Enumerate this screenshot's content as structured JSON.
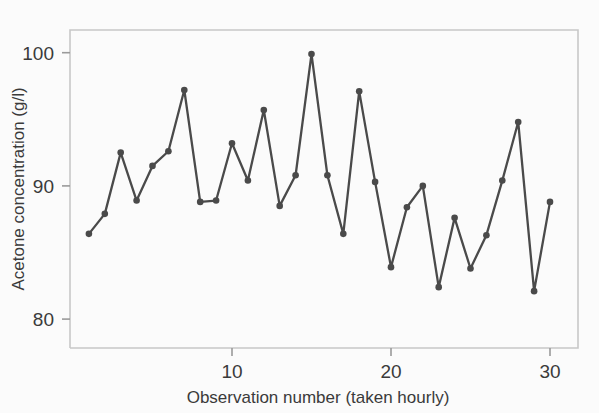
{
  "chart_data": {
    "type": "line",
    "title": "",
    "subtitle": "",
    "xlabel": "Observation number (taken hourly)",
    "ylabel": "Acetone concentration (g/l)",
    "xlim": [
      0.2,
      30.8
    ],
    "ylim": [
      77.5,
      101.2
    ],
    "xticks": [
      10,
      20,
      30
    ],
    "xtick_labels": [
      "10",
      "20",
      "30"
    ],
    "yticks": [
      80,
      90,
      100
    ],
    "ytick_labels": [
      "80",
      "90",
      "100"
    ],
    "grid": false,
    "legend": null,
    "marker": "circle",
    "line_color": "#4a4a4a",
    "marker_color": "#4a4a4a",
    "axis_color": "#b9b9b9",
    "background": "#fbfbfb",
    "x": [
      1,
      2,
      3,
      4,
      5,
      6,
      7,
      8,
      9,
      10,
      11,
      12,
      13,
      14,
      15,
      16,
      17,
      18,
      19,
      20,
      21,
      22,
      23,
      24,
      25,
      26,
      27,
      28,
      29,
      30
    ],
    "values": [
      86.4,
      87.9,
      92.5,
      88.9,
      91.5,
      92.6,
      97.2,
      88.8,
      88.9,
      93.2,
      90.4,
      95.7,
      88.5,
      90.8,
      99.9,
      90.8,
      86.4,
      97.1,
      90.3,
      83.9,
      88.4,
      90.0,
      82.4,
      87.6,
      83.8,
      86.3,
      90.4,
      94.8,
      82.1,
      88.8
    ],
    "series": [
      {
        "name": "Acetone concentration",
        "values": [
          86.4,
          87.9,
          92.5,
          88.9,
          91.5,
          92.6,
          97.2,
          88.8,
          88.9,
          93.2,
          90.4,
          95.7,
          88.5,
          90.8,
          99.9,
          90.8,
          86.4,
          97.1,
          90.3,
          83.9,
          88.4,
          90.0,
          82.4,
          87.6,
          83.8,
          86.3,
          90.4,
          94.8,
          82.1,
          88.8
        ]
      }
    ],
    "annotations": []
  },
  "axes": {
    "y_title": "Acetone concentration (g/l)",
    "x_title": "Observation number (taken hourly)",
    "y_tick_100": "100",
    "y_tick_90": "90",
    "y_tick_80": "80",
    "x_tick_10": "10",
    "x_tick_20": "20",
    "x_tick_30": "30"
  }
}
